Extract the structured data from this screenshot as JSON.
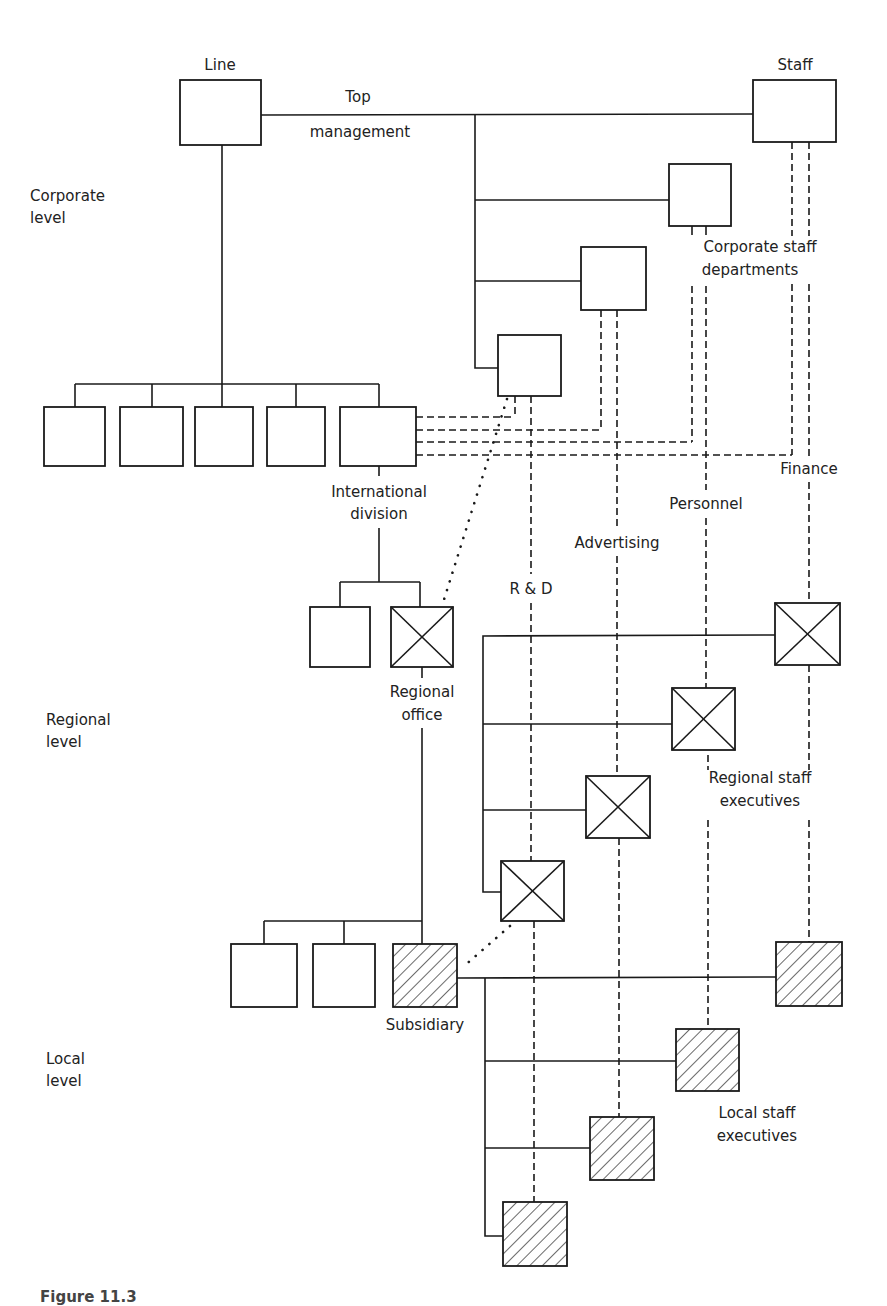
{
  "diagram": {
    "title_labels": {
      "line": "Line",
      "staff": "Staff",
      "top": "Top",
      "management": "management"
    },
    "level_labels": [
      {
        "line1": "Corporate",
        "line2": "level"
      },
      {
        "line1": "Regional",
        "line2": "level"
      },
      {
        "line1": "Local",
        "line2": "level"
      }
    ],
    "group_labels": {
      "corporate_staff_1": "Corporate staff",
      "corporate_staff_2": "departments",
      "international_1": "International",
      "international_2": "division",
      "regional_office_1": "Regional",
      "regional_office_2": "office",
      "regional_staff_1": "Regional staff",
      "regional_staff_2": "executives",
      "subsidiary": "Subsidiary",
      "local_staff_1": "Local staff",
      "local_staff_2": "executives"
    },
    "functions": [
      {
        "name": "R & D"
      },
      {
        "name": "Advertising"
      },
      {
        "name": "Personnel"
      },
      {
        "name": "Finance"
      }
    ],
    "legend": {
      "plain_box": "line/staff unit",
      "crossed_box": "regional staff executive",
      "hatched_box": "local unit"
    },
    "colors": {
      "stroke": "#1a1a1a",
      "background": "#ffffff"
    }
  },
  "caption": "Figure 11.3"
}
